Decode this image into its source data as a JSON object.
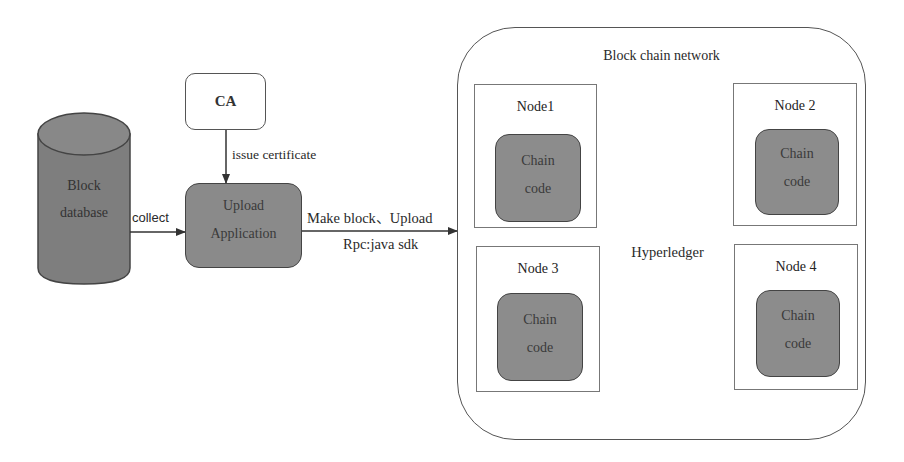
{
  "diagram": {
    "colors": {
      "dark_fill": "#8a8a8a",
      "light_fill": "#d6d6d6",
      "stroke": "#444444",
      "background": "#ffffff"
    },
    "block_database": {
      "shape": "cylinder",
      "line1": "Block",
      "line2": "database"
    },
    "ca": {
      "label": "CA"
    },
    "upload_application": {
      "line1": "Upload",
      "line2": "Application"
    },
    "edges": {
      "collect": "collect",
      "issue_certificate": "issue certificate",
      "make_block_upload": "Make block、Upload",
      "rpc": "Rpc:java sdk"
    },
    "network": {
      "title": "Block chain network",
      "hyperledger": "Hyperledger",
      "nodes": [
        {
          "title": "Node1",
          "chaincode_line1": "Chain",
          "chaincode_line2": "code"
        },
        {
          "title": "Node 2",
          "chaincode_line1": "Chain",
          "chaincode_line2": "code"
        },
        {
          "title": "Node 3",
          "chaincode_line1": "Chain",
          "chaincode_line2": "code"
        },
        {
          "title": "Node 4",
          "chaincode_line1": "Chain",
          "chaincode_line2": "code"
        }
      ]
    }
  }
}
